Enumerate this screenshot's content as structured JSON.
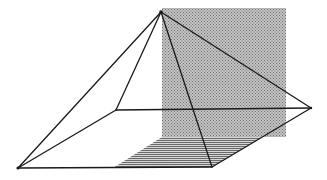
{
  "diagram": {
    "description": "Pyramid with apex above a quadrilateral base, intersected by a shaded vertical plane; base region behind plane hatched",
    "colors": {
      "line": "#1a1a1a",
      "plane_fill": "#b4b4b4",
      "plane_dot": "#7a7a7a",
      "hatch": "#6e6e6e",
      "background": "#ffffff"
    },
    "vertices": {
      "apex": [
        161,
        12
      ],
      "base_left": [
        18,
        168
      ],
      "base_back_left": [
        116,
        110
      ],
      "base_right": [
        311,
        108
      ],
      "base_front_right": [
        212,
        167
      ]
    },
    "plane_rect": {
      "x": 162,
      "y": 8,
      "width": 124,
      "height": 129
    },
    "hatched_region": [
      [
        162,
        137
      ],
      [
        262,
        137
      ],
      [
        212,
        167
      ],
      [
        113,
        168
      ]
    ]
  }
}
